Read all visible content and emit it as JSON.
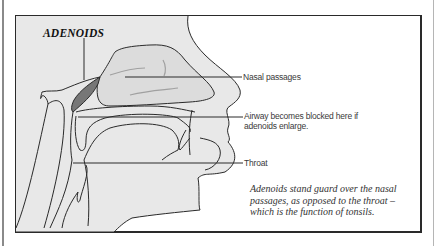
{
  "diagram": {
    "title": "ADENOIDS",
    "labels": [
      {
        "id": "nasal",
        "text": "Nasal passages"
      },
      {
        "id": "airway_line1",
        "text": "Airway becomes blocked here if"
      },
      {
        "id": "airway_line2",
        "text": "adenoids enlarge."
      },
      {
        "id": "throat",
        "text": "Throat"
      }
    ],
    "caption": "Adenoids stand guard over the nasal passages, as opposed to the throat – which is the function of tonsils.",
    "colors": {
      "tissue_fill": "#e6e6e6",
      "adenoid_fill": "#7a7a7a",
      "outline": "#2a2a2a"
    }
  }
}
